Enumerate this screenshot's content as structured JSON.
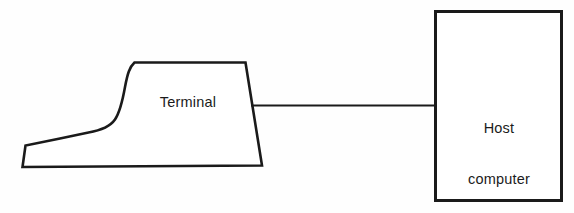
{
  "figure": {
    "background_color": "#fefefe",
    "stroke_color": "#1a1a1a",
    "width": 574,
    "height": 213
  },
  "terminal": {
    "label": "Terminal",
    "shape_name": "crt-terminal-silhouette",
    "fill_color": "#ffffff",
    "outline_color": "#1a1a1a",
    "outline_path": "M 22 167 L 25 145 L 88 133 C 104 131 114 126 120 113 C 126 100 128 80 134 62 L 246 62 L 262 165 Z"
  },
  "host": {
    "label_line_1": "Host",
    "label_line_2": "computer",
    "shape_name": "rectangle",
    "fill_color": "#ffffff",
    "outline_color": "#1a1a1a",
    "x": 434,
    "y": 10,
    "width": 128,
    "height": 192
  },
  "connection": {
    "name": "terminal-to-host-link",
    "color": "#1a1a1a",
    "x1": 251,
    "y1": 105,
    "x2": 434,
    "y2": 105
  }
}
